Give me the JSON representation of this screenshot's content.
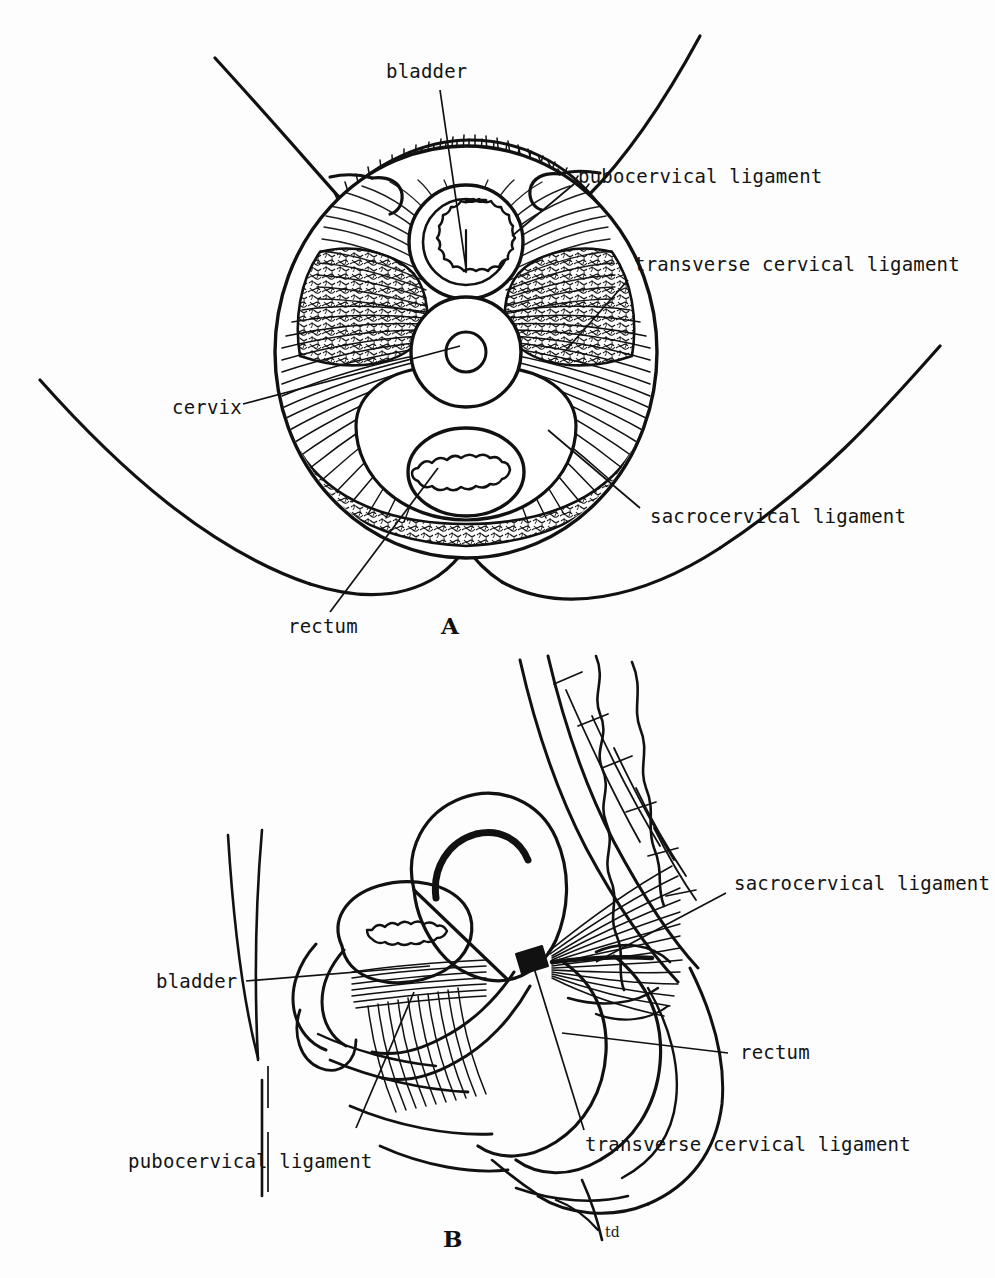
{
  "figure": {
    "type": "anatomical-line-drawing",
    "background_color": "#fdfdfd",
    "ink_color": "#111111"
  },
  "panels": [
    {
      "id": "A",
      "letter": "A",
      "view": "transverse (axial) section through the pelvis",
      "labels": [
        {
          "key": "bladder",
          "text": "bladder"
        },
        {
          "key": "pubocervical",
          "text": "pubocervical ligament"
        },
        {
          "key": "transverse_cervical",
          "text": "transverse cervical ligament"
        },
        {
          "key": "cervix",
          "text": "cervix"
        },
        {
          "key": "sacrocervical",
          "text": "sacrocervical ligament"
        },
        {
          "key": "rectum",
          "text": "rectum"
        }
      ]
    },
    {
      "id": "B",
      "letter": "B",
      "view": "median sagittal section through the pelvis",
      "labels": [
        {
          "key": "sacrocervical",
          "text": "sacrocervical ligament"
        },
        {
          "key": "bladder",
          "text": "bladder"
        },
        {
          "key": "rectum",
          "text": "rectum"
        },
        {
          "key": "pubocervical",
          "text": "pubocervical ligament"
        },
        {
          "key": "transverse_cervical",
          "text": "transverse cervical ligament"
        }
      ]
    }
  ],
  "signature": {
    "text": "td"
  }
}
